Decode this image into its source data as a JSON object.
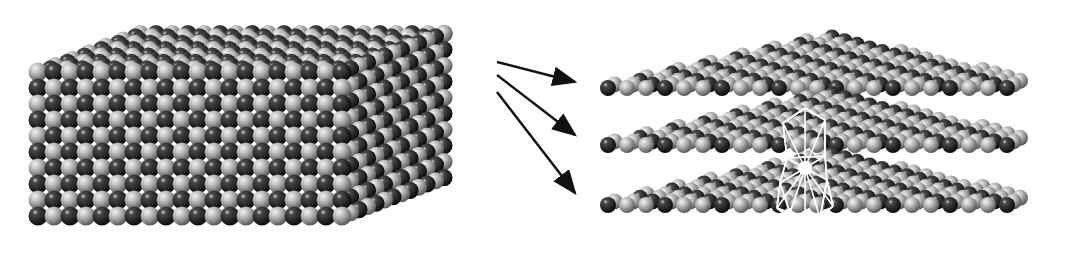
{
  "figure": {
    "colors": {
      "background": "#ffffff",
      "light_atom": "#b8b8b8",
      "light_atom_highlight": "#f2f2f2",
      "dark_atom": "#1a1a1a",
      "dark_atom_highlight": "#9a9a9a",
      "arrow": "#111111",
      "bond_lines": "#ffffff"
    },
    "bulk_block": {
      "front_rows": 10,
      "front_cols": 20,
      "side_cols": 12,
      "top_depth": 12
    },
    "arrows": [
      {
        "from": [
          497,
          62
        ],
        "to": [
          575,
          82
        ]
      },
      {
        "from": [
          497,
          75
        ],
        "to": [
          575,
          135
        ]
      },
      {
        "from": [
          497,
          92
        ],
        "to": [
          575,
          193
        ]
      }
    ],
    "slabs": [
      {
        "label": "layer-1",
        "y": 88
      },
      {
        "label": "layer-2",
        "y": 145
      },
      {
        "label": "layer-3",
        "y": 205
      }
    ],
    "bond_cluster": {
      "x": 805,
      "y": 168
    }
  }
}
